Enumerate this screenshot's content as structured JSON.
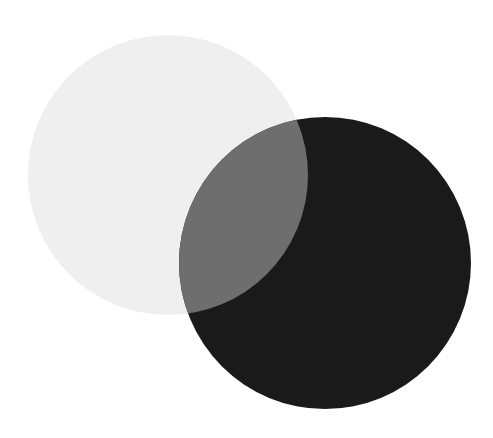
{
  "figure": {
    "background_color": "#ffffff",
    "width": 493,
    "height": 438
  },
  "chart_data": {
    "type": "venn",
    "title": "",
    "subtitle": "",
    "xlabel": "",
    "ylabel": "",
    "grid": false,
    "legend_position": "none",
    "background_color": "#ffffff",
    "canvas": {
      "width": 493,
      "height": 438
    },
    "sets": [
      {
        "name": "light-circle",
        "label": "",
        "center_x": 168,
        "center_y": 175,
        "radius": 140,
        "fill_color": "#efefef",
        "opacity": 1,
        "z_order": 1,
        "bounds": {
          "left": 28,
          "top": 35,
          "right": 308,
          "bottom": 315
        }
      },
      {
        "name": "dark-circle",
        "label": "",
        "center_x": 325,
        "center_y": 263,
        "radius": 146,
        "fill_color": "#1a1a1a",
        "opacity": 1,
        "z_order": 2,
        "bounds": {
          "left": 179,
          "top": 117,
          "right": 471,
          "bottom": 409
        }
      }
    ],
    "intersection": {
      "name": "overlap-region",
      "label": "",
      "fill_color": "#6e6e6e",
      "point_upper_x": 305,
      "point_upper_y": 120,
      "point_lower_x": 196,
      "point_lower_y": 313
    }
  },
  "colors": {
    "light": "#efefef",
    "dark": "#1a1a1a",
    "overlap": "#6e6e6e",
    "background": "#ffffff"
  }
}
